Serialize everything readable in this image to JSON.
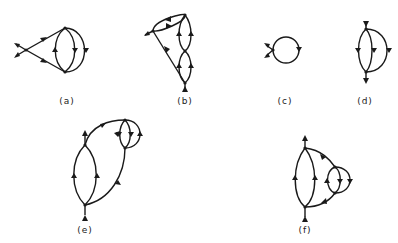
{
  "figure": {
    "panels": [
      {
        "id": "a",
        "label": "(a)",
        "description": "Two external legs meeting at a vertex, leading to a three-line loop (two vertices joined by three propagators)"
      },
      {
        "id": "b",
        "label": "(b)",
        "description": "Vertex chain with an external leg at left and bottom; stacked bubble loops on right"
      },
      {
        "id": "c",
        "label": "(c)",
        "description": "Single loop (tadpole) with two external legs at left"
      },
      {
        "id": "d",
        "label": "(d)",
        "description": "Sunset diagram: two vertices joined by three lines, external legs top and bottom"
      },
      {
        "id": "e",
        "label": "(e)",
        "description": "Large loop with external legs top and bottom, attached to upper-right sunset insertion"
      },
      {
        "id": "f",
        "label": "(f)",
        "description": "Large loop with external legs top and bottom, right arc with sunset insertion"
      }
    ]
  },
  "colors": {
    "stroke": "#1a1a1a",
    "background": "#ffffff"
  }
}
